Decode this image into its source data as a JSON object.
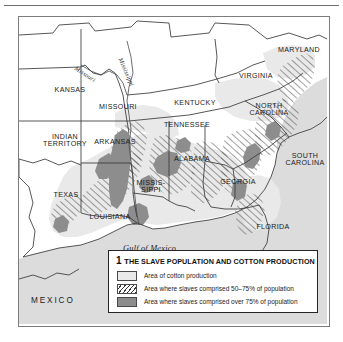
{
  "map": {
    "title": "The slave population and cotton production map of the southern United States",
    "figure_number": "1",
    "states": [
      {
        "name": "KANSAS",
        "x": 28,
        "y": 70
      },
      {
        "name": "MISSOURI",
        "x": 78,
        "y": 87
      },
      {
        "name": "INDIAN\nTERRITORY",
        "x": 24,
        "y": 120
      },
      {
        "name": "ARKANSAS",
        "x": 77,
        "y": 123
      },
      {
        "name": "TEXAS",
        "x": 35,
        "y": 175
      },
      {
        "name": "LOUISIANA",
        "x": 74,
        "y": 198
      },
      {
        "name": "MISSIS-\nSIPPI",
        "x": 123,
        "y": 168
      },
      {
        "name": "ALABAMA",
        "x": 167,
        "y": 140
      },
      {
        "name": "TENNESSEE",
        "x": 162,
        "y": 106
      },
      {
        "name": "KENTUCKY",
        "x": 170,
        "y": 86
      },
      {
        "name": "VIRGINIA",
        "x": 235,
        "y": 58
      },
      {
        "name": "MARYLAND",
        "x": 277,
        "y": 32
      },
      {
        "name": "NORTH\nCAROLINA",
        "x": 243,
        "y": 90
      },
      {
        "name": "SOUTH\nCAROLINA",
        "x": 282,
        "y": 140
      },
      {
        "name": "GEORGIA",
        "x": 215,
        "y": 163
      },
      {
        "name": "FLORIDA",
        "x": 253,
        "y": 208
      },
      {
        "name": "MEXICO",
        "x": 24,
        "y": 283
      }
    ],
    "water_labels": [
      {
        "name": "Gulf of Mexico",
        "x": 130,
        "y": 232
      }
    ],
    "river_labels": [
      {
        "name": "Missouri",
        "x": 73,
        "y": 59
      },
      {
        "name": "Mississippi",
        "x": 117,
        "y": 60
      }
    ]
  },
  "legend": {
    "number": "1",
    "title_lead": "T",
    "title_rest": "HE SLAVE POPULATION AND COTTON PRODUCTION",
    "items": [
      {
        "swatch": "cotton-swatch",
        "label": "Area of cotton production"
      },
      {
        "swatch": "hatch-swatch",
        "label": "Area where slaves comprised 50–75% of population"
      },
      {
        "swatch": "dark-swatch",
        "label": "Area where slaves comprised over 75% of population"
      }
    ]
  },
  "colors": {
    "cotton": "#e9e9e9",
    "hatch_line": "#3a3a3a",
    "dark_area": "#8d8d8d",
    "water": "#dcdcdc",
    "border": "#3a3a3a",
    "frame": "#7d7d7d"
  }
}
